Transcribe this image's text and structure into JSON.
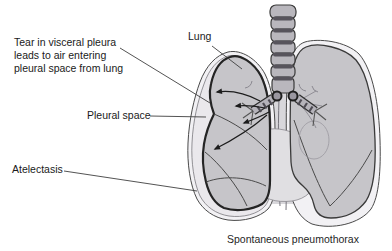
{
  "figure": {
    "caption": "Spontaneous pneumothorax",
    "labels": {
      "tear": "Tear in visceral pleura\nleads to air entering\npleural space from lung",
      "lung": "Lung",
      "pleural_space": "Pleural space",
      "atelectasis": "Atelectasis"
    },
    "colors": {
      "background": "#ffffff",
      "lung_fill": "#c6c5c9",
      "collapsed_lung_outline": "#242424",
      "pleural_cavity_fill": "#f2f1f4",
      "pleural_air_fill": "#eae8ec",
      "heart_fill": "#e0dfe2",
      "mediastinum_fill": "#d8d7db",
      "trachea_fill": "#b9b7bd",
      "trachea_band": "#57545c",
      "outline": "#3f3f3f",
      "arrow": "#1c1c1c",
      "label_text": "#1a1a1a"
    }
  }
}
